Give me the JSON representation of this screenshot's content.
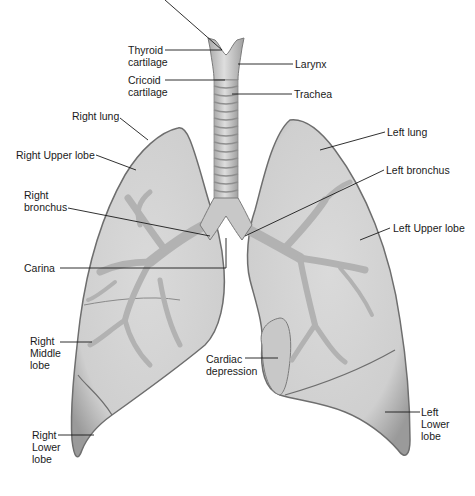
{
  "diagram": {
    "colors": {
      "lung_fill": "#d6d6d6",
      "lung_edge": "#6e6e6e",
      "bronchi": "#b4b4b4",
      "trachea_fill": "#cfcfcf",
      "line": "#1a1a1a",
      "background": "#ffffff"
    },
    "labels": {
      "thyroid_cartilage": "Thyroid\ncartilage",
      "cricoid_cartilage": "Cricoid\ncartilage",
      "larynx": "Larynx",
      "trachea": "Trachea",
      "right_lung": "Right lung",
      "right_upper_lobe": "Right Upper lobe",
      "right_bronchus": "Right\nbronchus",
      "carina": "Carina",
      "right_middle_lobe": "Right\nMiddle\nlobe",
      "right_lower_lobe": "Right\nLower\nlobe",
      "left_lung": "Left lung",
      "left_bronchus": "Left bronchus",
      "left_upper_lobe": "Left Upper lobe",
      "cardiac_depression": "Cardiac\ndepression",
      "left_lower_lobe": "Left\nLower\nlobe"
    }
  }
}
